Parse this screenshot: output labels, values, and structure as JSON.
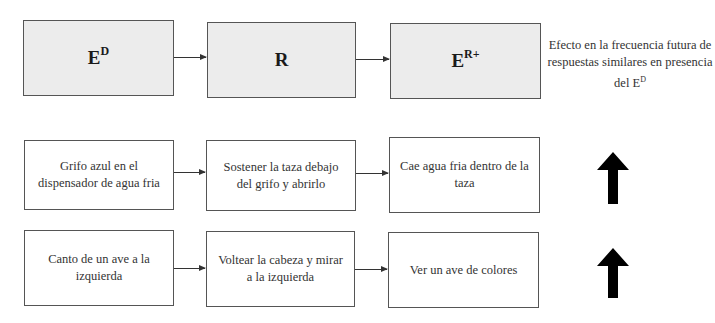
{
  "header": {
    "discriminative_stimulus": {
      "base": "E",
      "sup": "D"
    },
    "response": {
      "base": "R"
    },
    "reinforcer": {
      "base": "E",
      "sup": "R+"
    },
    "effect_description": "Efecto en la frecuencia futura de respuestas similares en presencia del E",
    "effect_description_sup": "D"
  },
  "examples": [
    {
      "stimulus": "Grifo azul en el dispensador de agua fria",
      "response": "Sostener la taza debajo del grifo y abrirlo",
      "consequence": "Cae agua fria dentro de la taza",
      "effect_icon": "up-arrow-icon",
      "effect": "increase"
    },
    {
      "stimulus": "Canto de un ave a la izquierda",
      "response": "Voltear la cabeza y mirar a la izquierda",
      "consequence": "Ver un ave de colores",
      "effect_icon": "up-arrow-icon",
      "effect": "increase"
    }
  ],
  "colors": {
    "shaded_box": "#ececec",
    "border": "#555555",
    "arrow": "#000000"
  }
}
